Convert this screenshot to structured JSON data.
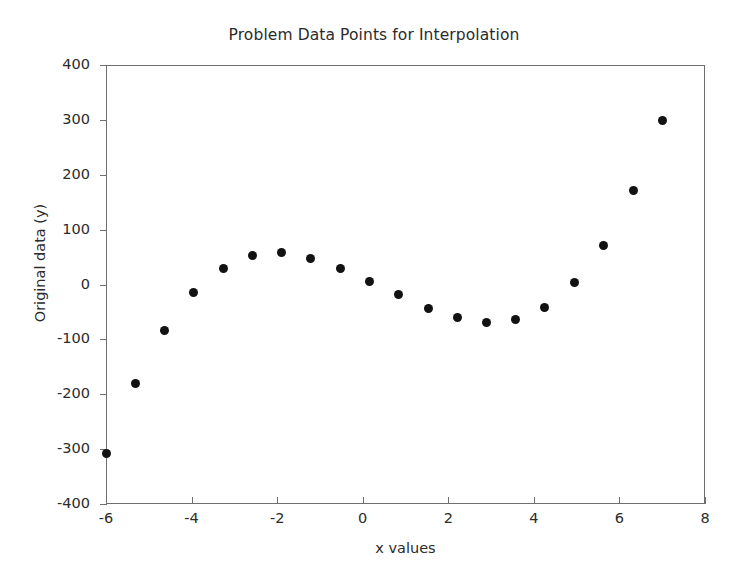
{
  "chart_data": {
    "type": "scatter",
    "title": "Problem Data Points for Interpolation",
    "xlabel": "x values",
    "ylabel": "Original data (y)",
    "xlim": [
      -6,
      8
    ],
    "ylim": [
      -400,
      400
    ],
    "xticks": [
      -6,
      -4,
      -2,
      0,
      2,
      4,
      6,
      8
    ],
    "xtick_labels": [
      "-6",
      "-4",
      "-2",
      "0",
      "2",
      "4",
      "6",
      "8"
    ],
    "yticks": [
      -400,
      -300,
      -200,
      -100,
      0,
      100,
      200,
      300,
      400
    ],
    "ytick_labels": [
      "-400",
      "-300",
      "-200",
      "-100",
      "0",
      "100",
      "200",
      "300",
      "400"
    ],
    "grid": false,
    "legend": false,
    "marker": "circle",
    "marker_color": "#121212",
    "marker_size": 9,
    "series": [
      {
        "name": "Original data",
        "x": [
          -6.0,
          -5.32,
          -4.63,
          -3.95,
          -3.26,
          -2.58,
          -1.89,
          -1.21,
          -0.53,
          0.16,
          0.84,
          1.53,
          2.21,
          2.89,
          3.58,
          4.26,
          4.95,
          5.63,
          6.32,
          7.0
        ],
        "y": [
          -308,
          -180,
          -84,
          -14,
          29,
          52,
          58,
          48,
          30,
          6,
          -18,
          -43,
          -61,
          -70,
          -64,
          -42,
          4,
          71,
          171,
          298
        ]
      }
    ]
  },
  "figure": {
    "background_color": "#ffffff",
    "axis_color": "#6f6f6f",
    "text_color": "#2b2b2b"
  }
}
